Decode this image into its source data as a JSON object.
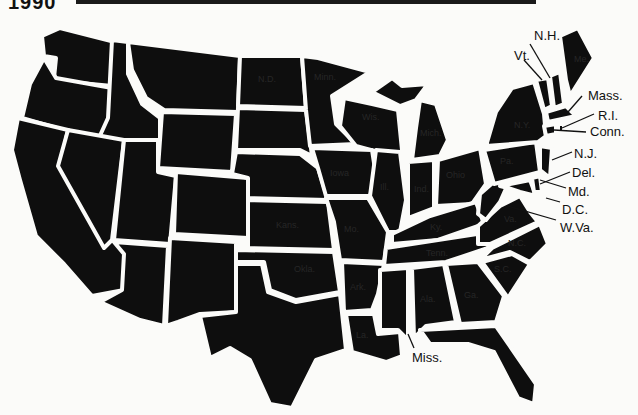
{
  "header": {
    "fragment": "1990"
  },
  "map": {
    "title": "",
    "fill_color": "#0e0e0e",
    "border_color": "#fbfbf9",
    "background_color": "#fbfbf9",
    "inner_labels": {
      "nd": "N.D.",
      "minn": "Minn.",
      "wis": "Wis.",
      "mich": "Mich.",
      "ohio": "Ohio",
      "pa": "Pa.",
      "ny": "N.Y.",
      "va": "Va.",
      "nc": "N.C.",
      "sc": "S.C.",
      "ga": "Ga.",
      "ala": "Ala.",
      "ark": "Ark.",
      "la": "La.",
      "mo": "Mo.",
      "ill": "Ill.",
      "ind": "Ind.",
      "ky": "Ky.",
      "iowa": "Iowa",
      "kans": "Kans.",
      "okla": "Okla.",
      "tenn": "Tenn.",
      "maine": "Me."
    },
    "callouts": {
      "vt": "Vt.",
      "nh": "N.H.",
      "mass": "Mass.",
      "ri": "R.I.",
      "conn": "Conn.",
      "nj": "N.J.",
      "del": "Del.",
      "md": "Md.",
      "dc": "D.C.",
      "wva": "W.Va.",
      "miss": "Miss."
    }
  }
}
